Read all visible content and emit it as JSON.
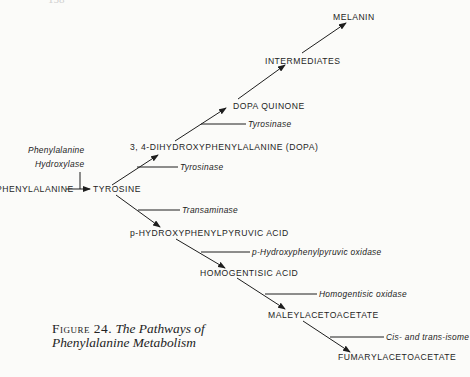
{
  "page_header": "158",
  "diagram": {
    "nodes": {
      "melanin": "MELANIN",
      "intermediates": "INTERMEDIATES",
      "dopa_quinone": "DOPA QUINONE",
      "dopa": "3, 4-DIHYDROXYPHENYLALANINE (DOPA)",
      "phenylalanine": "PHENYLALANINE",
      "tyrosine": "TYROSINE",
      "p_hppa": "p-HYDROXYPHENYLPYRUVIC ACID",
      "homogentisic_acid": "HOMOGENTISIC ACID",
      "maleylacetoacetate": "MALEYLACETOACETATE",
      "fumarylacetoacetate": "FUMARYLACETOACETATE"
    },
    "enzymes": {
      "phenylalanine_hydroxylase_line1": "Phenylalanine",
      "phenylalanine_hydroxylase_line2": "Hydroxylase",
      "tyrosinase_dopa_to_quinone": "Tyrosinase",
      "tyrosinase_tyrosine_to_dopa": "Tyrosinase",
      "transaminase": "Transaminase",
      "p_hppa_oxidase": "p-Hydroxyphenylpyruvic oxidase",
      "homogentisic_oxidase": "Homogentisic oxidase",
      "isomerase": "Cis- and trans-isome"
    },
    "edges": [
      {
        "from": "PHENYLALANINE",
        "to": "TYROSINE",
        "enzyme": "Phenylalanine Hydroxylase"
      },
      {
        "from": "TYROSINE",
        "to": "3, 4-DIHYDROXYPHENYLALANINE (DOPA)",
        "enzyme": "Tyrosinase"
      },
      {
        "from": "3, 4-DIHYDROXYPHENYLALANINE (DOPA)",
        "to": "DOPA QUINONE",
        "enzyme": "Tyrosinase"
      },
      {
        "from": "DOPA QUINONE",
        "to": "INTERMEDIATES",
        "enzyme": ""
      },
      {
        "from": "INTERMEDIATES",
        "to": "MELANIN",
        "enzyme": ""
      },
      {
        "from": "TYROSINE",
        "to": "p-HYDROXYPHENYLPYRUVIC ACID",
        "enzyme": "Transaminase"
      },
      {
        "from": "p-HYDROXYPHENYLPYRUVIC ACID",
        "to": "HOMOGENTISIC ACID",
        "enzyme": "p-Hydroxyphenylpyruvic oxidase"
      },
      {
        "from": "HOMOGENTISIC ACID",
        "to": "MALEYLACETOACETATE",
        "enzyme": "Homogentisic oxidase"
      },
      {
        "from": "MALEYLACETOACETATE",
        "to": "FUMARYLACETOACETATE",
        "enzyme": "Cis- and trans-isomerase"
      }
    ]
  },
  "caption": {
    "figure_label": "Figure 24.",
    "title_line1": "The Pathways of",
    "title_line2": "Phenylalanine  Metabolism"
  },
  "colors": {
    "ink": "#1e1e1e",
    "paper": "#fbfbf9"
  }
}
